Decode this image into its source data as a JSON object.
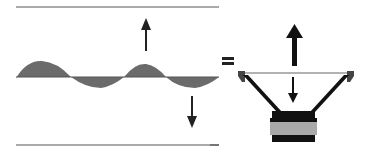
{
  "diagram": {
    "equals_sign": "=",
    "colors": {
      "background": "#ffffff",
      "line": "#555555",
      "wave_fill": "#6e6e6e",
      "arrow": "#111111",
      "speaker_frame": "#1a1a1a",
      "speaker_cone_edge": "#999999",
      "magnet": "#a9a9a9",
      "speaker_base": "#111111"
    },
    "elements": {
      "top_boundary": "upper boundary line",
      "bottom_boundary": "lower boundary line",
      "wave": "sine wave",
      "up_arrow": "upward arrow",
      "down_arrow": "downward arrow",
      "speaker": "loudspeaker cross-section",
      "speaker_up_arrow": "bold upward arrow",
      "speaker_down_arrow": "downward arrow"
    }
  }
}
